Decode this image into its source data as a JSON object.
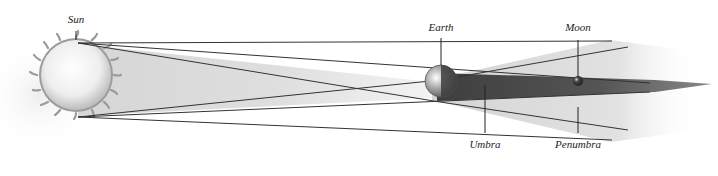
{
  "diagram": {
    "labels": {
      "sun": "Sun",
      "earth": "Earth",
      "moon": "Moon",
      "umbra": "Umbra",
      "penumbra": "Penumbra"
    },
    "colors": {
      "background": "#ffffff",
      "sun_fill": "#f4f4f4",
      "sun_flares": "#9a9a9a",
      "penumbra_cone": "#d9d9d9",
      "umbra_cone": "#4a4a4a",
      "lines": "#333333",
      "earth": "#8a8a8a",
      "moon": "#2e2e2e"
    }
  }
}
